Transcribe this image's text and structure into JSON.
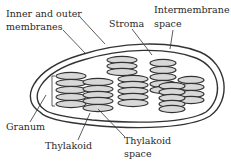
{
  "diagram": {
    "labels": {
      "membranes_line1": "Inner and outer",
      "membranes_line2": "membranes",
      "stroma": "Stroma",
      "intermembrane_line1": "Intermembrane",
      "intermembrane_line2": "space",
      "granum": "Granum",
      "thylakoid": "Thylakoid",
      "thylakoid_space_line1": "Thylakoid",
      "thylakoid_space_line2": "space"
    },
    "colors": {
      "outline": "#333333",
      "disk_fill": "#d8d8d8",
      "background": "#ffffff",
      "text": "#2a2a2a"
    }
  }
}
